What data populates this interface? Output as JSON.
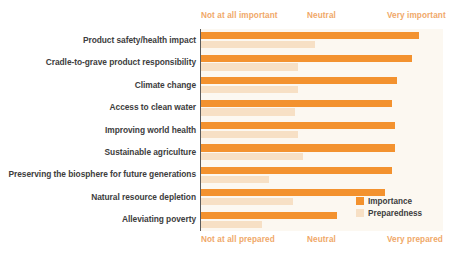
{
  "chart_data": {
    "type": "bar",
    "orientation": "horizontal",
    "title": "",
    "xlabel": "",
    "ylabel": "",
    "grid": false,
    "legend_position": "bottom-right",
    "xlim": [
      0,
      100
    ],
    "top_axis": {
      "label_left": "Not at all important",
      "label_mid": "Neutral",
      "label_right": "Very important"
    },
    "bottom_axis": {
      "label_left": "Not at all prepared",
      "label_mid": "Neutral",
      "label_right": "Very prepared"
    },
    "categories": [
      "Product safety/health impact",
      "Cradle-to-grave product responsibility",
      "Climate change",
      "Access to clean water",
      "Improving world health",
      "Sustainable agriculture",
      "Preserving the biosphere for future generations",
      "Natural resource depletion",
      "Alleviating poverty"
    ],
    "series": [
      {
        "name": "Importance",
        "color": "#F3922F",
        "values": [
          90,
          87,
          81,
          79,
          80,
          80,
          79,
          76,
          56
        ]
      },
      {
        "name": "Preparedness",
        "color": "#F7E0C5",
        "values": [
          47,
          40,
          40,
          39,
          40,
          42,
          28,
          38,
          25
        ]
      }
    ]
  },
  "legend": {
    "items": [
      {
        "label": "Importance"
      },
      {
        "label": "Preparedness"
      }
    ]
  },
  "colors": {
    "importance": "#F3922F",
    "preparedness": "#F7E0C5",
    "plot_background": "#FCF8F1",
    "axis_caption": "#F0A868",
    "category_label": "#3d3d3d",
    "axis_line": "#5b5b5b"
  }
}
